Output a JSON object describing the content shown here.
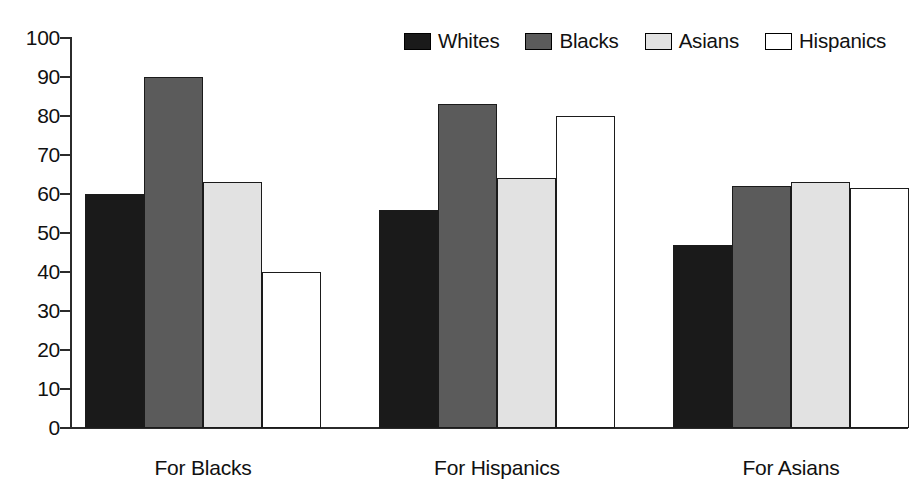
{
  "chart_data": {
    "type": "bar",
    "title": "",
    "subtitle": "",
    "xlabel": "",
    "ylabel": "",
    "categories": [
      "For Blacks",
      "For Hispanics",
      "For Asians"
    ],
    "series": [
      {
        "name": "Whites",
        "values": [
          60,
          56,
          47
        ],
        "color": "#1a1a1a"
      },
      {
        "name": "Blacks",
        "values": [
          90,
          83,
          62
        ],
        "color": "#5b5b5b"
      },
      {
        "name": "Asians",
        "values": [
          63,
          64,
          63
        ],
        "color": "#e2e2e2"
      },
      {
        "name": "Hispanics",
        "values": [
          40,
          80,
          61.5
        ],
        "color": "#ffffff"
      }
    ],
    "ylim": [
      0,
      100
    ],
    "yticks": [
      0,
      10,
      20,
      30,
      40,
      50,
      60,
      70,
      80,
      90,
      100
    ],
    "ytick_labels": [
      "0",
      "10",
      "20",
      "30",
      "40",
      "50",
      "60",
      "70",
      "80",
      "90",
      "100"
    ],
    "grid": false,
    "legend_position": "top-right",
    "legend_entries": [
      "Whites",
      "Blacks",
      "Asians",
      "Hispanics"
    ],
    "axis_color": "#2b2b2b",
    "bar_outline_color": "#1b1b1b",
    "background_color": "#ffffff"
  }
}
